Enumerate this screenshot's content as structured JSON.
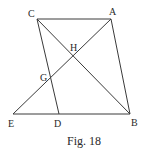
{
  "figure": {
    "caption": "Fig. 18",
    "line_color": "#3a3a3a",
    "points": {
      "A": {
        "label": "A",
        "x": 111,
        "y": 19
      },
      "B": {
        "label": "B",
        "x": 130,
        "y": 114
      },
      "C": {
        "label": "C",
        "x": 37,
        "y": 19
      },
      "D": {
        "label": "D",
        "x": 59,
        "y": 114
      },
      "E": {
        "label": "E",
        "x": 13,
        "y": 114
      },
      "G": {
        "label": "G",
        "x": 51,
        "y": 78
      },
      "H": {
        "label": "H",
        "x": 73,
        "y": 56
      }
    },
    "segments": [
      {
        "from": "C",
        "to": "A"
      },
      {
        "from": "A",
        "to": "B"
      },
      {
        "from": "E",
        "to": "B"
      },
      {
        "from": "C",
        "to": "D"
      },
      {
        "from": "C",
        "to": "B"
      },
      {
        "from": "E",
        "to": "A"
      }
    ]
  }
}
